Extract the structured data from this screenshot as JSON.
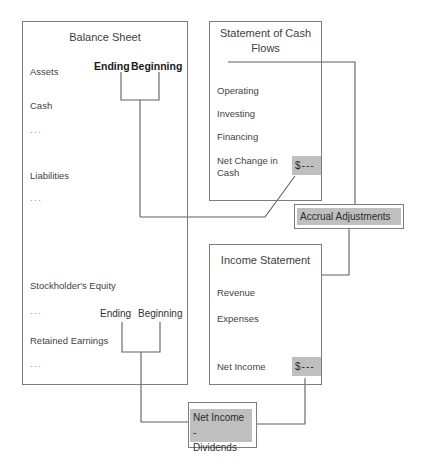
{
  "diagram": {
    "title_hidden": "Financial statement articulation diagram",
    "stroke_color": "#7d7d7d",
    "chip_color": "#bfbfbf",
    "text_color": "#3f3f3f"
  },
  "balance_sheet": {
    "title": "Balance Sheet",
    "items": [
      {
        "label": "Assets"
      },
      {
        "label": "Cash"
      },
      {
        "label": "..."
      },
      {
        "label": "Liabilities"
      },
      {
        "label": "..."
      },
      {
        "label": "Stockholder's Equity"
      },
      {
        "label": "..."
      },
      {
        "label": "Retained Earnings"
      },
      {
        "label": "..."
      }
    ],
    "top_bracket": {
      "left_label": "Ending",
      "right_label": "Beginning"
    },
    "bottom_bracket": {
      "left_label": "Ending",
      "right_label": "Beginning"
    }
  },
  "cash_flows": {
    "title": "Statement of Cash\nFlows",
    "items": [
      {
        "label": "Operating"
      },
      {
        "label": "Investing"
      },
      {
        "label": "Financing"
      },
      {
        "label": "Net Change in\nCash"
      }
    ],
    "amount": "$---"
  },
  "income_statement": {
    "title": "Income Statement",
    "items": [
      {
        "label": "Revenue"
      },
      {
        "label": "Expenses"
      },
      {
        "label": "Net Income"
      }
    ],
    "amount": "$---"
  },
  "callouts": [
    {
      "label": "Accrual Adjustments"
    },
    {
      "label": "Net Income -\nDividends"
    }
  ]
}
